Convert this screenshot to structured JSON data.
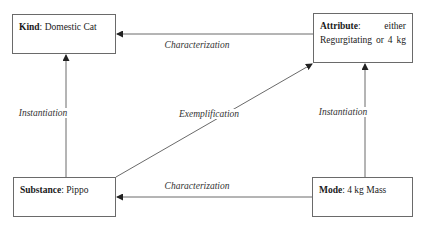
{
  "nodes": {
    "kind": {
      "key": "Kind",
      "value": "Domestic Cat"
    },
    "attribute": {
      "key": "Attribute",
      "value_line1": "either",
      "value_line2_words": [
        "Regurgitating",
        "or",
        "4",
        "kg"
      ]
    },
    "substance": {
      "key": "Substance",
      "value": "Pippo"
    },
    "mode": {
      "key": "Mode",
      "value": "4 kg Mass"
    }
  },
  "edges": {
    "attribute_to_kind": "Characterization",
    "mode_to_substance": "Characterization",
    "substance_to_kind": "Instantiation",
    "mode_to_attribute": "Instantiation",
    "substance_to_attribute": "Exemplification"
  },
  "colors": {
    "line": "#6a6a6a",
    "text": "#1a1a1a"
  }
}
